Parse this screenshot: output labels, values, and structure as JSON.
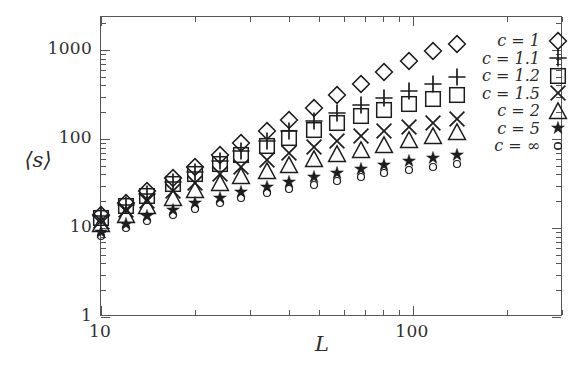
{
  "figure": {
    "ylabel": "⟨s⟩",
    "xlabel": "L"
  },
  "axes": {
    "x_ticklabels": [
      "10",
      "100"
    ],
    "y_ticklabels": [
      "1",
      "10",
      "100",
      "1000"
    ]
  },
  "legend": {
    "entries": [
      {
        "label": "c = 1",
        "symbol": "diamond-icon"
      },
      {
        "label": "c = 1.1",
        "symbol": "plus-icon"
      },
      {
        "label": "c = 1.2",
        "symbol": "square-icon"
      },
      {
        "label": "c = 1.5",
        "symbol": "cross-icon"
      },
      {
        "label": "c = 2",
        "symbol": "triangle-icon"
      },
      {
        "label": "c = 5",
        "symbol": "star-icon"
      },
      {
        "label": "c = ∞",
        "symbol": "circle-icon"
      }
    ]
  },
  "chart_data": {
    "type": "scatter",
    "title": "",
    "xlabel": "L",
    "ylabel": "⟨s⟩",
    "xscale": "log",
    "yscale": "log",
    "xlim": [
      10,
      200
    ],
    "ylim": [
      1,
      2200
    ],
    "grid": false,
    "legend_position": "right-top",
    "x": [
      10,
      12,
      14,
      17,
      20,
      24,
      28,
      34,
      40,
      48,
      57,
      68,
      81,
      97,
      116,
      138
    ],
    "series": [
      {
        "name": "c = 1",
        "marker": "diamond",
        "values": [
          14,
          19,
          26,
          36,
          48,
          66,
          90,
          122,
          165,
          225,
          310,
          420,
          560,
          760,
          980,
          1180
        ]
      },
      {
        "name": "c = 1.1",
        "marker": "plus",
        "values": [
          13.5,
          18,
          24,
          33,
          43,
          57,
          74,
          96,
          124,
          158,
          196,
          240,
          290,
          350,
          420,
          500
        ]
      },
      {
        "name": "c = 1.2",
        "marker": "square",
        "values": [
          13,
          17.5,
          23,
          31,
          40,
          52,
          66,
          83,
          103,
          126,
          152,
          182,
          212,
          245,
          280,
          310
        ]
      },
      {
        "name": "c = 1.5",
        "marker": "cross",
        "values": [
          12,
          16,
          20,
          26,
          32,
          40,
          49,
          58,
          69,
          81,
          94,
          107,
          122,
          137,
          152,
          168
        ]
      },
      {
        "name": "c = 2",
        "marker": "triangle",
        "values": [
          11,
          14,
          17.5,
          22,
          26.5,
          32,
          38,
          44,
          51,
          59,
          67,
          76,
          86,
          97,
          108,
          120
        ]
      },
      {
        "name": "c = 5",
        "marker": "star",
        "values": [
          9.0,
          11,
          13.5,
          16,
          19,
          22,
          25.5,
          29,
          33,
          37,
          41.5,
          46,
          51,
          56,
          61,
          66
        ]
      },
      {
        "name": "c = ∞",
        "marker": "circle",
        "values": [
          8.2,
          10,
          12,
          14,
          16.5,
          19,
          21.5,
          24.5,
          27.5,
          30.5,
          34,
          37.5,
          41,
          45,
          49,
          53
        ]
      }
    ]
  }
}
